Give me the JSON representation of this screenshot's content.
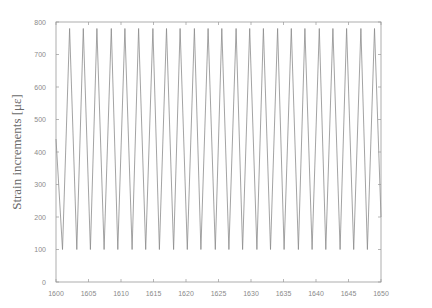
{
  "chart_data": {
    "type": "line",
    "title": "",
    "xlabel": "",
    "ylabel": "Strain increments [με]",
    "xlim": [
      1600,
      1650
    ],
    "ylim": [
      0,
      800
    ],
    "xticks": [
      1600,
      1605,
      1610,
      1615,
      1620,
      1625,
      1630,
      1635,
      1640,
      1645,
      1650
    ],
    "yticks": [
      0,
      100,
      200,
      300,
      400,
      500,
      600,
      700,
      800
    ],
    "grid": false,
    "legend": null,
    "series": [
      {
        "name": "strain",
        "color": "#8c8c8c",
        "waveform": "triangular",
        "period": 2.14,
        "min": 100,
        "max": 780,
        "first_trough_x": 1601.0,
        "x": [
          1600.0,
          1601.0,
          1602.1,
          1603.2,
          1604.2,
          1605.3,
          1606.3,
          1607.4,
          1608.5,
          1609.5,
          1610.6,
          1611.7,
          1612.7,
          1613.8,
          1614.9,
          1615.9,
          1617.0,
          1618.1,
          1619.1,
          1620.2,
          1621.3,
          1622.3,
          1623.4,
          1624.5,
          1625.5,
          1626.6,
          1627.7,
          1628.7,
          1629.8,
          1630.9,
          1631.9,
          1633.0,
          1634.1,
          1635.1,
          1636.2,
          1637.3,
          1638.3,
          1639.4,
          1640.5,
          1641.5,
          1642.6,
          1643.7,
          1644.7,
          1645.8,
          1646.9,
          1647.9,
          1649.0,
          1650.0
        ],
        "y": [
          440,
          100,
          780,
          100,
          780,
          100,
          780,
          100,
          780,
          100,
          780,
          100,
          780,
          100,
          780,
          100,
          780,
          100,
          780,
          100,
          780,
          100,
          780,
          100,
          780,
          100,
          780,
          100,
          780,
          100,
          780,
          100,
          780,
          100,
          780,
          100,
          780,
          100,
          780,
          100,
          780,
          100,
          780,
          100,
          780,
          100,
          780,
          200
        ]
      }
    ]
  },
  "colors": {
    "axis": "#9a9a9a",
    "line": "#8c8c8c",
    "text": "#8a8a8a"
  }
}
